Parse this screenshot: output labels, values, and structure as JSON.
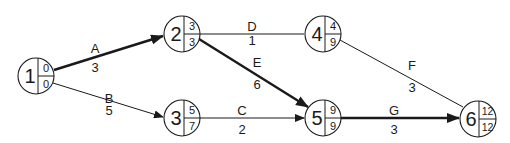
{
  "diagram": {
    "type": "activity-on-arrow network (critical path)",
    "nodes": [
      {
        "id": "1",
        "top": "0",
        "bottom": "0",
        "x": 36,
        "y": 76
      },
      {
        "id": "2",
        "top": "3",
        "bottom": "3",
        "x": 182,
        "y": 34
      },
      {
        "id": "3",
        "top": "5",
        "bottom": "7",
        "x": 182,
        "y": 118
      },
      {
        "id": "4",
        "top": "4",
        "bottom": "9",
        "x": 323,
        "y": 34
      },
      {
        "id": "5",
        "top": "9",
        "bottom": "9",
        "x": 323,
        "y": 118
      },
      {
        "id": "6",
        "top": "12",
        "bottom": "12",
        "x": 478,
        "y": 119
      }
    ],
    "edges": [
      {
        "activity": "A",
        "duration": "3",
        "from": "1",
        "to": "2",
        "critical": true
      },
      {
        "activity": "B",
        "duration": "5",
        "from": "1",
        "to": "3",
        "critical": false
      },
      {
        "activity": "D",
        "duration": "1",
        "from": "2",
        "to": "4",
        "critical": false
      },
      {
        "activity": "E",
        "duration": "6",
        "from": "2",
        "to": "5",
        "critical": true
      },
      {
        "activity": "C",
        "duration": "2",
        "from": "3",
        "to": "5",
        "critical": false
      },
      {
        "activity": "F",
        "duration": "3",
        "from": "4",
        "to": "6",
        "critical": false
      },
      {
        "activity": "G",
        "duration": "3",
        "from": "5",
        "to": "6",
        "critical": true
      }
    ]
  }
}
